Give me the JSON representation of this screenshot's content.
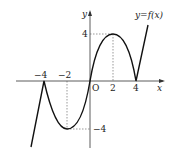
{
  "diagram": {
    "curve_label": "y=f(x)",
    "axis_x_label": "x",
    "axis_y_label": "y",
    "origin_label": "O",
    "x_ticks": [
      "-4",
      "-2",
      "2",
      "4"
    ],
    "y_ticks": [
      "4",
      "-4"
    ],
    "key_points": [
      {
        "x": -4,
        "y": 0,
        "type": "cusp"
      },
      {
        "x": -2,
        "y": -4,
        "type": "local minimum"
      },
      {
        "x": 0,
        "y": 0,
        "type": "origin"
      },
      {
        "x": 2,
        "y": 4,
        "type": "local maximum"
      },
      {
        "x": 4,
        "y": 0,
        "type": "cusp"
      }
    ]
  }
}
